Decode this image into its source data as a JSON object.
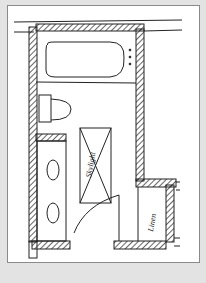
{
  "diagram": {
    "type": "floor-plan-sketch",
    "rooms": [
      "bathroom"
    ],
    "labels": {
      "skylight": "Skylight",
      "linen": "Linen"
    },
    "fixtures": [
      "bathtub",
      "toilet",
      "double-vanity-sinks",
      "skylight",
      "door",
      "linen-closet"
    ],
    "colors": {
      "background": "#e3e3e3",
      "paper": "#ffffff",
      "ink": "#222222"
    }
  }
}
